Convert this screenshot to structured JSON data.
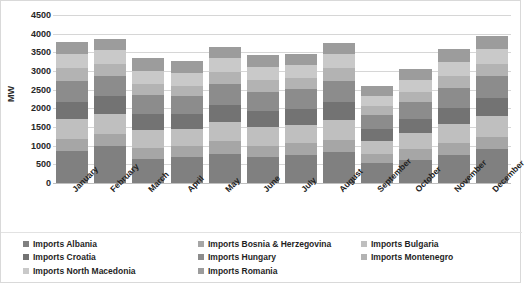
{
  "chart_data": {
    "type": "bar",
    "subtype": "stacked-column",
    "title": "",
    "xlabel": "",
    "ylabel": "MW",
    "ylim": [
      0,
      4500
    ],
    "ytick_step": 500,
    "yticks": [
      "4500",
      "4000",
      "3500",
      "3000",
      "2500",
      "2000",
      "1500",
      "1000",
      "500",
      "0"
    ],
    "grid": true,
    "legend_position": "bottom",
    "legend_columns": 3,
    "categories": [
      "January",
      "February",
      "March",
      "April",
      "May",
      "June",
      "July",
      "August",
      "September",
      "October",
      "November",
      "December"
    ],
    "series": [
      {
        "name": "Imports Albania",
        "color": "#808080",
        "values": [
          870,
          980,
          650,
          700,
          790,
          700,
          760,
          840,
          540,
          620,
          760,
          900
        ]
      },
      {
        "name": "Imports Bosnia & Herzegovina",
        "color": "#a6a6a6",
        "values": [
          310,
          320,
          300,
          290,
          330,
          300,
          300,
          320,
          230,
          290,
          310,
          330
        ]
      },
      {
        "name": "Imports Bulgaria",
        "color": "#bfbfbf",
        "values": [
          530,
          560,
          480,
          450,
          520,
          490,
          500,
          540,
          360,
          430,
          500,
          560
        ]
      },
      {
        "name": "Imports Croatia",
        "color": "#737373",
        "values": [
          470,
          460,
          420,
          400,
          450,
          430,
          430,
          470,
          320,
          380,
          440,
          480
        ]
      },
      {
        "name": "Imports Hungary",
        "color": "#8c8c8c",
        "values": [
          560,
          540,
          500,
          480,
          560,
          520,
          520,
          570,
          380,
          450,
          540,
          590
        ]
      },
      {
        "name": "Imports Montenegro",
        "color": "#b3b3b3",
        "values": [
          330,
          320,
          300,
          290,
          320,
          310,
          300,
          330,
          230,
          270,
          310,
          340
        ]
      },
      {
        "name": "Imports North Macedonia",
        "color": "#c9c9c9",
        "values": [
          400,
          380,
          350,
          330,
          370,
          360,
          350,
          390,
          280,
          320,
          370,
          400
        ]
      },
      {
        "name": "Imports Romania",
        "color": "#9c9c9c",
        "values": [
          310,
          300,
          360,
          320,
          300,
          310,
          300,
          300,
          260,
          290,
          350,
          330
        ]
      }
    ],
    "totals": [
      3780,
      3860,
      3360,
      3260,
      3640,
      3420,
      3460,
      3760,
      2600,
      3050,
      3580,
      3930
    ]
  },
  "legend": {
    "columns": [
      [
        "Imports Albania",
        "Imports Croatia",
        "Imports North Macedonia"
      ],
      [
        "Imports Bosnia & Herzegovina",
        "Imports Hungary",
        "Imports Romania"
      ],
      [
        "Imports Bulgaria",
        "Imports Montenegro"
      ]
    ]
  }
}
